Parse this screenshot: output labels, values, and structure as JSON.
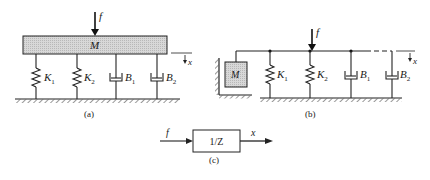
{
  "figure": {
    "panels": [
      {
        "id": "a",
        "caption": "(a)",
        "mass_label": "M",
        "force_label": "f",
        "displacement_label": "x",
        "elements": [
          {
            "type": "spring",
            "label": "K",
            "sub": "1"
          },
          {
            "type": "spring",
            "label": "K",
            "sub": "2"
          },
          {
            "type": "damper",
            "label": "B",
            "sub": "1"
          },
          {
            "type": "damper",
            "label": "B",
            "sub": "2"
          }
        ]
      },
      {
        "id": "b",
        "caption": "(b)",
        "mass_label": "M",
        "force_label": "f",
        "displacement_label": "x",
        "elements": [
          {
            "type": "spring",
            "label": "K",
            "sub": "1"
          },
          {
            "type": "spring",
            "label": "K",
            "sub": "2"
          },
          {
            "type": "damper",
            "label": "B",
            "sub": "1"
          },
          {
            "type": "damper",
            "label": "B",
            "sub": "2"
          }
        ]
      },
      {
        "id": "c",
        "caption": "(c)",
        "input_label": "f",
        "block_label": "1/Z",
        "output_label": "x"
      }
    ]
  }
}
